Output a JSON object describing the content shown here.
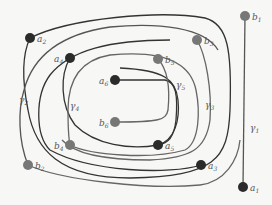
{
  "diagram": {
    "title": "",
    "colors": {
      "dark_node": "#2b2b2b",
      "light_node": "#777777",
      "curve": "#3a3a3a",
      "curve_light": "#666666",
      "background": "#f7f7f5"
    },
    "nodes": [
      {
        "id": "a1",
        "base": "a",
        "sub": "1",
        "x": 243,
        "y": 187,
        "shade": "dark"
      },
      {
        "id": "b1",
        "base": "b",
        "sub": "1",
        "x": 245,
        "y": 16,
        "shade": "light"
      },
      {
        "id": "a2",
        "base": "a",
        "sub": "2",
        "x": 30,
        "y": 38,
        "shade": "dark"
      },
      {
        "id": "b2",
        "base": "b",
        "sub": "2",
        "x": 28,
        "y": 165,
        "shade": "light"
      },
      {
        "id": "a3",
        "base": "a",
        "sub": "3",
        "x": 201,
        "y": 165,
        "shade": "dark"
      },
      {
        "id": "b3",
        "base": "b",
        "sub": "3",
        "x": 197,
        "y": 40,
        "shade": "light"
      },
      {
        "id": "a4",
        "base": "a",
        "sub": "4",
        "x": 70,
        "y": 58,
        "shade": "dark"
      },
      {
        "id": "b4",
        "base": "b",
        "sub": "4",
        "x": 70,
        "y": 145,
        "shade": "light"
      },
      {
        "id": "a5",
        "base": "a",
        "sub": "5",
        "x": 158,
        "y": 145,
        "shade": "dark"
      },
      {
        "id": "b5",
        "base": "b",
        "sub": "5",
        "x": 158,
        "y": 59,
        "shade": "light"
      },
      {
        "id": "a6",
        "base": "a",
        "sub": "6",
        "x": 115,
        "y": 80,
        "shade": "dark"
      },
      {
        "id": "b6",
        "base": "b",
        "sub": "6",
        "x": 115,
        "y": 122,
        "shade": "light"
      }
    ],
    "curve_labels": [
      {
        "id": "gamma1",
        "base": "γ",
        "sub": "1",
        "x": 250,
        "y": 131
      },
      {
        "id": "gamma2",
        "base": "γ",
        "sub": "2",
        "x": 19,
        "y": 103
      },
      {
        "id": "gamma3",
        "base": "γ",
        "sub": "3",
        "x": 205,
        "y": 108
      },
      {
        "id": "gamma4",
        "base": "γ",
        "sub": "4",
        "x": 70,
        "y": 109
      },
      {
        "id": "gamma5",
        "base": "γ",
        "sub": "5",
        "x": 176,
        "y": 88
      }
    ]
  }
}
